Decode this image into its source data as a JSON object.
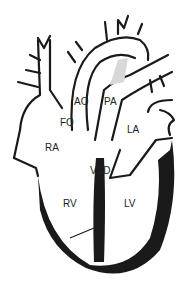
{
  "diagram": {
    "labels": {
      "ao": "AO",
      "pa": "PA",
      "fo": "FO",
      "ra": "RA",
      "la": "LA",
      "vsd": "VSD",
      "rv": "RV",
      "lv": "LV"
    },
    "colors": {
      "stroke": "#1a1a1a",
      "fill": "#ffffff",
      "muscle": "#1a1a1a",
      "shunt": "#d8d8d8"
    }
  }
}
